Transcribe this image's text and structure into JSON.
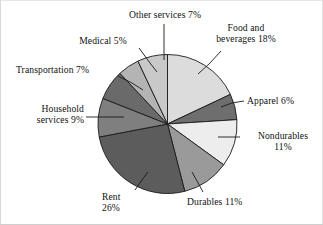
{
  "chart_data": {
    "type": "pie",
    "title": "",
    "subtitle": "",
    "units": "percent",
    "legend_position": "none",
    "labels_style": "leader-lines",
    "total": 100,
    "categories": [
      "Food and beverages",
      "Apparel",
      "Nondurables",
      "Durables",
      "Rent",
      "Household services",
      "Transportation",
      "Medical",
      "Other services"
    ],
    "values": [
      18,
      6,
      11,
      11,
      26,
      9,
      7,
      5,
      7
    ],
    "colors": [
      "#dcdcdc",
      "#6e6e6e",
      "#ededed",
      "#9a9a9a",
      "#5c5c5c",
      "#7f7f7f",
      "#6a6a6a",
      "#b4b4b4",
      "#c9c9c9"
    ],
    "slice_order": "clockwise from 12 o'clock",
    "stroke": "#1a1a1a"
  },
  "labels": {
    "other_services": {
      "line1": "Other services 7%",
      "line2": ""
    },
    "food_beverages": {
      "line1": "Food and",
      "line2": "beverages 18%"
    },
    "medical": {
      "line1": "Medical 5%",
      "line2": ""
    },
    "transportation": {
      "line1": "Transportation 7%",
      "line2": ""
    },
    "household_services": {
      "line1": "Household",
      "line2": "services 9%"
    },
    "apparel": {
      "line1": "Apparel 6%",
      "line2": ""
    },
    "nondurables": {
      "line1": "Nondurables",
      "line2": "11%"
    },
    "durables": {
      "line1": "Durables 11%",
      "line2": ""
    },
    "rent": {
      "line1": "Rent",
      "line2": "26%"
    }
  }
}
